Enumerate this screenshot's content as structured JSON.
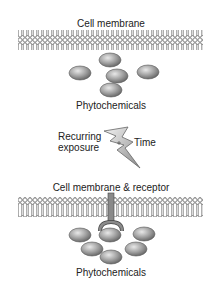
{
  "diagram": {
    "top_panel": {
      "membrane_label": "Cell membrane",
      "molecules_label": "Phytochemicals",
      "molecule_count": 5
    },
    "transition": {
      "left_label_line1": "Recurring",
      "left_label_line2": "exposure",
      "right_label": "Time",
      "icon": "lightning-bolt-icon"
    },
    "bottom_panel": {
      "membrane_label": "Cell membrane & receptor",
      "molecules_label": "Phytochemicals",
      "molecule_count": 6
    },
    "colors": {
      "molecule_fill": "#9a9a9a",
      "membrane_stroke": "#555555",
      "text": "#222222"
    }
  }
}
